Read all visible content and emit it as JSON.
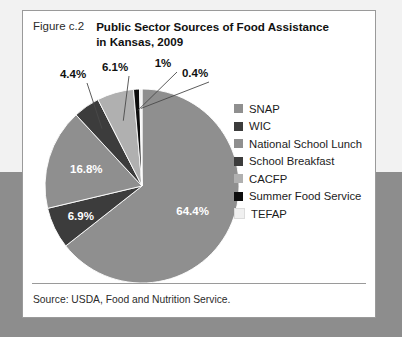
{
  "figure": {
    "number_label": "Figure c.2",
    "title_line_1": "Public Sector Sources of Food Assistance",
    "title_line_2": "in Kansas, 2009",
    "source": "Source: USDA, Food and Nutrition Service."
  },
  "chart_data": {
    "type": "pie",
    "title": "Public Sector Sources of Food Assistance in Kansas, 2009",
    "xlabel": "",
    "ylabel": "",
    "legend_position": "right",
    "grid": false,
    "unit": "percent",
    "labels": [
      "SNAP",
      "WIC",
      "National School Lunch",
      "School Breakfast",
      "CACFP",
      "Summer Food Service",
      "TEFAP"
    ],
    "values": [
      64.4,
      6.9,
      16.8,
      4.4,
      6.1,
      1.0,
      0.4
    ],
    "value_labels": [
      "64.4%",
      "6.9%",
      "16.8%",
      "4.4%",
      "6.1%",
      "1%",
      "0.4%"
    ],
    "colors": [
      "#8f8f8f",
      "#3c3c3c",
      "#8f8f8f",
      "#3c3c3c",
      "#b0b0b0",
      "#0d0d0d",
      "#f0f0f0"
    ],
    "slices": [
      {
        "label": "SNAP",
        "value": 64.4,
        "value_label": "64.4%",
        "color": "#8f8f8f"
      },
      {
        "label": "WIC",
        "value": 6.9,
        "value_label": "6.9%",
        "color": "#3c3c3c"
      },
      {
        "label": "National School Lunch",
        "value": 16.8,
        "value_label": "16.8%",
        "color": "#8f8f8f"
      },
      {
        "label": "School Breakfast",
        "value": 4.4,
        "value_label": "4.4%",
        "color": "#3c3c3c"
      },
      {
        "label": "CACFP",
        "value": 6.1,
        "value_label": "6.1%",
        "color": "#b0b0b0"
      },
      {
        "label": "Summer Food Service",
        "value": 1.0,
        "value_label": "1%",
        "color": "#0d0d0d"
      },
      {
        "label": "TEFAP",
        "value": 0.4,
        "value_label": "0.4%",
        "color": "#f0f0f0"
      }
    ]
  },
  "legend": {
    "items": [
      {
        "label": "SNAP",
        "color": "#8f8f8f"
      },
      {
        "label": "WIC",
        "color": "#3c3c3c"
      },
      {
        "label": "National School Lunch",
        "color": "#8f8f8f"
      },
      {
        "label": "School Breakfast",
        "color": "#3c3c3c"
      },
      {
        "label": "CACFP",
        "color": "#b0b0b0"
      },
      {
        "label": "Summer Food Service",
        "color": "#0d0d0d"
      },
      {
        "label": "TEFAP",
        "color": "#f0f0f0"
      }
    ]
  }
}
